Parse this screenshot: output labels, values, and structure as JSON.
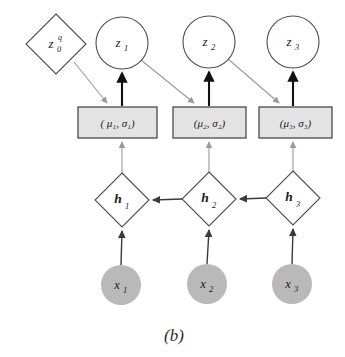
{
  "figure": {
    "caption": "(b)",
    "background_color": "#ffffff",
    "colors": {
      "open_node_fill": "#ffffff",
      "open_node_stroke": "#4d4d4d",
      "box_fill": "#e3e3e3",
      "box_stroke": "#4a4a4a",
      "observed_fill": "#b9b9b9",
      "gray_edge": "#9a9a9a",
      "black_edge": "#111111",
      "dark_edge": "#3a3a3a",
      "text": "#1a1a1a"
    }
  },
  "nodes": {
    "prior": {
      "id": "z0q",
      "shape": "diamond",
      "base": "z",
      "subscript": "0",
      "superscript": "q",
      "cx": 56,
      "cy": 44,
      "rx": 30,
      "ry": 30
    },
    "latents": [
      {
        "id": "z1",
        "shape": "circle",
        "base": "z",
        "subscript": "1",
        "cx": 122,
        "cy": 43,
        "r": 26
      },
      {
        "id": "z2",
        "shape": "circle",
        "base": "z",
        "subscript": "2",
        "cx": 209,
        "cy": 42,
        "r": 26
      },
      {
        "id": "z3",
        "shape": "circle",
        "base": "z",
        "subscript": "3",
        "cx": 293,
        "cy": 42,
        "r": 26
      }
    ],
    "params": [
      {
        "id": "p1",
        "shape": "rect",
        "text": "( μ₁, σ₁)",
        "x": 78,
        "y": 107,
        "w": 79,
        "h": 31
      },
      {
        "id": "p2",
        "shape": "rect",
        "text": "(μ₂, σ₂)",
        "x": 173,
        "y": 107,
        "w": 73,
        "h": 31
      },
      {
        "id": "p3",
        "shape": "rect",
        "text": "(μ₃, σ₃)",
        "x": 259,
        "y": 107,
        "w": 73,
        "h": 31
      }
    ],
    "hidden": [
      {
        "id": "h1",
        "shape": "diamond",
        "base": "h",
        "subscript": "1",
        "cx": 122,
        "cy": 200,
        "rx": 27,
        "ry": 27
      },
      {
        "id": "h2",
        "shape": "diamond",
        "base": "h",
        "subscript": "2",
        "cx": 209,
        "cy": 199,
        "rx": 27,
        "ry": 27
      },
      {
        "id": "h3",
        "shape": "diamond",
        "base": "h",
        "subscript": "3",
        "cx": 293,
        "cy": 198,
        "rx": 27,
        "ry": 27
      }
    ],
    "observed": [
      {
        "id": "x1",
        "shape": "circle",
        "base": "x",
        "subscript": "1",
        "cx": 121,
        "cy": 285,
        "r": 20
      },
      {
        "id": "x2",
        "shape": "circle",
        "base": "x",
        "subscript": "2",
        "cx": 207,
        "cy": 284,
        "r": 20
      },
      {
        "id": "x3",
        "shape": "circle",
        "base": "x",
        "subscript": "3",
        "cx": 292,
        "cy": 284,
        "r": 20
      }
    ]
  },
  "edges": {
    "gray_diagonal": [
      {
        "name": "z0q-to-p1",
        "from": "z0q",
        "to": "p1"
      },
      {
        "name": "z1-to-p2",
        "from": "z1",
        "to": "p2"
      },
      {
        "name": "z2-to-p3",
        "from": "z2",
        "to": "p3"
      }
    ],
    "black_vertical": [
      {
        "name": "p1-to-z1",
        "from": "p1",
        "to": "z1"
      },
      {
        "name": "p2-to-z2",
        "from": "p2",
        "to": "z2"
      },
      {
        "name": "p3-to-z3",
        "from": "p3",
        "to": "z3"
      }
    ],
    "gray_vertical": [
      {
        "name": "h1-to-p1",
        "from": "h1",
        "to": "p1"
      },
      {
        "name": "h2-to-p2",
        "from": "h2",
        "to": "p2"
      },
      {
        "name": "h3-to-p3",
        "from": "h3",
        "to": "p3"
      }
    ],
    "recurrent_horizontal": [
      {
        "name": "h2-to-h1",
        "from": "h2",
        "to": "h1"
      },
      {
        "name": "h3-to-h2",
        "from": "h3",
        "to": "h2"
      }
    ],
    "input_vertical": [
      {
        "name": "x1-to-h1",
        "from": "x1",
        "to": "h1"
      },
      {
        "name": "x2-to-h2",
        "from": "x2",
        "to": "h2"
      },
      {
        "name": "x3-to-h3",
        "from": "x3",
        "to": "h3"
      }
    ]
  }
}
